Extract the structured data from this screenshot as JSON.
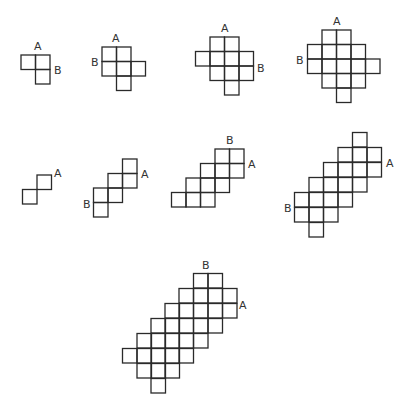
{
  "diagram": {
    "cell_size": 14.5,
    "figures": [
      {
        "id": "fig-1",
        "rows": [
          {
            "y": 55,
            "xs": [
              21,
              35.5
            ]
          },
          {
            "y": 69.5,
            "xs": [
              35.5
            ]
          }
        ],
        "labels": [
          {
            "text": "A",
            "x": 34,
            "y": 50
          },
          {
            "text": "B",
            "x": 54,
            "y": 74
          }
        ]
      },
      {
        "id": "fig-2",
        "rows": [
          {
            "y": 47,
            "xs": [
              102,
              116.5
            ]
          },
          {
            "y": 61.5,
            "xs": [
              102,
              116.5,
              131
            ]
          },
          {
            "y": 76,
            "xs": [
              116.5
            ]
          }
        ],
        "labels": [
          {
            "text": "A",
            "x": 112,
            "y": 42
          },
          {
            "text": "B",
            "x": 91,
            "y": 66
          }
        ]
      },
      {
        "id": "fig-3",
        "rows": [
          {
            "y": 37,
            "xs": [
              210,
              224.5
            ]
          },
          {
            "y": 51.5,
            "xs": [
              195.5,
              210,
              224.5,
              239
            ]
          },
          {
            "y": 66,
            "xs": [
              210,
              224.5,
              239
            ]
          },
          {
            "y": 80.5,
            "xs": [
              224.5
            ]
          }
        ],
        "labels": [
          {
            "text": "A",
            "x": 221,
            "y": 32
          },
          {
            "text": "B",
            "x": 257,
            "y": 72
          }
        ]
      },
      {
        "id": "fig-4",
        "rows": [
          {
            "y": 30,
            "xs": [
              322,
              336.5
            ]
          },
          {
            "y": 44.5,
            "xs": [
              307.5,
              322,
              336.5,
              351
            ]
          },
          {
            "y": 59,
            "xs": [
              307.5,
              322,
              336.5,
              351,
              365.5
            ]
          },
          {
            "y": 73.5,
            "xs": [
              322,
              336.5,
              351
            ]
          },
          {
            "y": 88,
            "xs": [
              336.5
            ]
          }
        ],
        "labels": [
          {
            "text": "A",
            "x": 333,
            "y": 25
          },
          {
            "text": "B",
            "x": 296,
            "y": 64
          }
        ]
      },
      {
        "id": "fig-5",
        "rows": [
          {
            "y": 175,
            "xs": [
              37
            ]
          },
          {
            "y": 189.5,
            "xs": [
              22.5
            ]
          }
        ],
        "labels": [
          {
            "text": "A",
            "x": 54,
            "y": 177
          }
        ]
      },
      {
        "id": "fig-6",
        "rows": [
          {
            "y": 159,
            "xs": [
              122.5
            ]
          },
          {
            "y": 173.5,
            "xs": [
              108,
              122.5
            ]
          },
          {
            "y": 188,
            "xs": [
              93.5,
              108
            ]
          },
          {
            "y": 202.5,
            "xs": [
              93.5
            ]
          }
        ],
        "labels": [
          {
            "text": "A",
            "x": 141,
            "y": 178
          },
          {
            "text": "B",
            "x": 83,
            "y": 208
          }
        ]
      },
      {
        "id": "fig-7",
        "rows": [
          {
            "y": 149,
            "xs": [
              215,
              229.5
            ]
          },
          {
            "y": 163.5,
            "xs": [
              200.5,
              215,
              229.5
            ]
          },
          {
            "y": 178,
            "xs": [
              186,
              200.5,
              215
            ]
          },
          {
            "y": 192.5,
            "xs": [
              171.5,
              186,
              200.5
            ]
          }
        ],
        "labels": [
          {
            "text": "A",
            "x": 248,
            "y": 168
          },
          {
            "text": "B",
            "x": 226,
            "y": 144
          }
        ]
      },
      {
        "id": "fig-8",
        "rows": [
          {
            "y": 132.5,
            "xs": [
              352.5
            ]
          },
          {
            "y": 147.5,
            "xs": [
              338,
              352.5,
              367
            ]
          },
          {
            "y": 162.5,
            "xs": [
              323.5,
              338,
              352.5,
              367
            ]
          },
          {
            "y": 177.5,
            "xs": [
              309,
              323.5,
              338,
              352.5
            ]
          },
          {
            "y": 192.5,
            "xs": [
              294.5,
              309,
              323.5,
              338
            ]
          },
          {
            "y": 207.5,
            "xs": [
              294.5,
              309,
              323.5
            ]
          },
          {
            "y": 222.5,
            "xs": [
              309
            ]
          }
        ],
        "labels": [
          {
            "text": "A",
            "x": 386,
            "y": 167
          },
          {
            "text": "B",
            "x": 284,
            "y": 212
          }
        ]
      },
      {
        "id": "fig-9",
        "rows": [
          {
            "y": 273.5,
            "xs": [
              193.5,
              208
            ]
          },
          {
            "y": 288.5,
            "xs": [
              179,
              193.5,
              208,
              222.5
            ]
          },
          {
            "y": 303.5,
            "xs": [
              165,
              179,
              193.5,
              208,
              222.5
            ]
          },
          {
            "y": 318.5,
            "xs": [
              151,
              165,
              179,
              193.5,
              208
            ]
          },
          {
            "y": 333.5,
            "xs": [
              137,
              151,
              165,
              179,
              193.5
            ]
          },
          {
            "y": 348.5,
            "xs": [
              122.5,
              137,
              151,
              165,
              179
            ]
          },
          {
            "y": 363.5,
            "xs": [
              137,
              151,
              165
            ]
          },
          {
            "y": 378.5,
            "xs": [
              151
            ]
          }
        ],
        "labels": [
          {
            "text": "A",
            "x": 239,
            "y": 309
          },
          {
            "text": "B",
            "x": 202,
            "y": 269
          }
        ]
      }
    ]
  }
}
